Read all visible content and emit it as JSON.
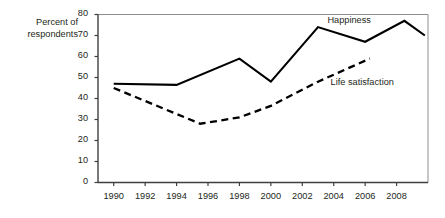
{
  "chart_data": {
    "type": "line",
    "title": "",
    "subtitle": "",
    "xlabel": "",
    "ylabel": "Percent of respondents",
    "ylabel_line1": "Percent of",
    "ylabel_line2": "respondents",
    "xlim": [
      1989,
      2010
    ],
    "ylim": [
      0,
      80
    ],
    "y_ticks": [
      0,
      10,
      20,
      30,
      40,
      50,
      60,
      70,
      80
    ],
    "y_tick_labels": [
      "0",
      "10",
      "20",
      "30",
      "40",
      "50",
      "60",
      "70",
      "80"
    ],
    "x_ticks": [
      1990,
      1992,
      1994,
      1996,
      1998,
      2000,
      2002,
      2004,
      2006,
      2008
    ],
    "x_tick_labels": [
      "1990",
      "1992",
      "1994",
      "1996",
      "1998",
      "2000",
      "2002",
      "2004",
      "2006",
      "2008"
    ],
    "grid": false,
    "legend_position": "inline-annotation",
    "series": [
      {
        "name": "Happiness",
        "style": "solid",
        "color": "#000000",
        "label_x": 2003.6,
        "label_y": 76.5,
        "x": [
          1990,
          1994,
          1998,
          2000,
          2003,
          2006,
          2008.5,
          2009.8
        ],
        "values": [
          47,
          46.5,
          59,
          48,
          74,
          67,
          77,
          70
        ]
      },
      {
        "name": "Life satisfaction",
        "style": "dashed",
        "color": "#000000",
        "label_x": 2003.8,
        "label_y": 47,
        "x": [
          1990,
          1995.5,
          1998,
          2000,
          2003,
          2006.3
        ],
        "values": [
          45,
          28,
          31,
          36.5,
          48,
          59
        ]
      }
    ]
  },
  "axis": {
    "y_title_line1": "Percent of",
    "y_title_line2": "respondents"
  },
  "labels": {
    "happiness": "Happiness",
    "life_satisfaction": "Life satisfaction"
  }
}
